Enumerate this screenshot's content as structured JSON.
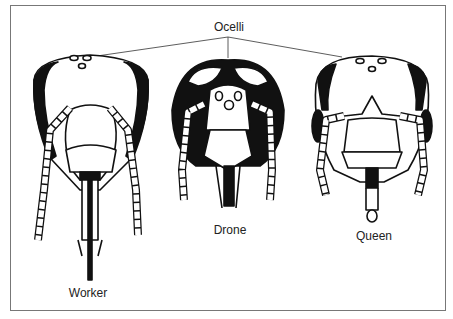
{
  "figure": {
    "type": "diagram",
    "callout": {
      "label": "Ocelli"
    },
    "heads": [
      {
        "label": "Worker"
      },
      {
        "label": "Drone"
      },
      {
        "label": "Queen"
      }
    ]
  },
  "colors": {
    "ink": "#111111",
    "border": "#777777",
    "background": "#ffffff"
  }
}
